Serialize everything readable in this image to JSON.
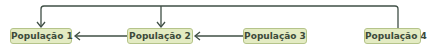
{
  "diagram": {
    "nodes": [
      {
        "id": "p1",
        "label": "População 1"
      },
      {
        "id": "p2",
        "label": "População 2"
      },
      {
        "id": "p3",
        "label": "População 3"
      },
      {
        "id": "p4",
        "label": "População 4"
      }
    ],
    "edges": [
      {
        "from": "p2",
        "to": "p1"
      },
      {
        "from": "p3",
        "to": "p2"
      },
      {
        "from": "p4",
        "to": "p1"
      },
      {
        "from": "p4",
        "to": "p2"
      }
    ],
    "colors": {
      "node_fill": "#e3ebc2",
      "node_border": "#b5c48a",
      "line": "#3f4f45",
      "text": "#3c4a3a"
    }
  }
}
